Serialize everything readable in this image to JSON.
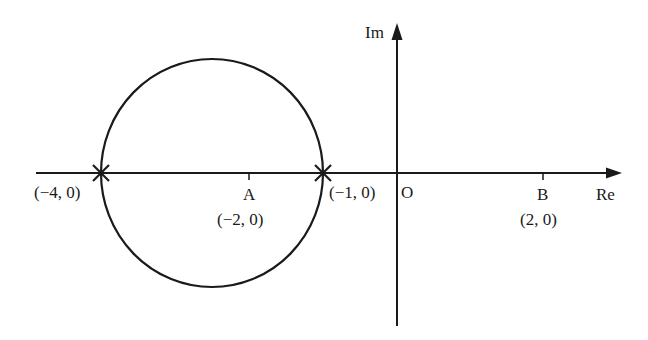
{
  "diagram": {
    "type": "complex-plane",
    "axes": {
      "real_label": "Re",
      "imag_label": "Im",
      "origin_label": "O"
    },
    "circle": {
      "center": [
        -2,
        0
      ],
      "radius": 1.5,
      "note": "circle through (-4,0) and (-1,0)"
    },
    "points": [
      {
        "id": "p1",
        "label": "(−4, 0)",
        "marker": "cross"
      },
      {
        "id": "p2",
        "label": "(−1, 0)",
        "marker": "cross"
      },
      {
        "id": "A",
        "name": "A",
        "label": "(−2, 0)",
        "marker": "tick"
      },
      {
        "id": "B",
        "name": "B",
        "label": "(2, 0)",
        "marker": "tick"
      }
    ],
    "colors": {
      "line": "#1a1a1a",
      "background": "#ffffff"
    }
  }
}
